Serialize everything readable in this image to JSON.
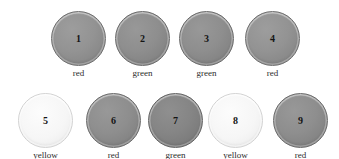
{
  "figure": {
    "background_color": "#ffffff",
    "rows": 2,
    "total_disks": 9
  },
  "disks": [
    {
      "number": "1",
      "label": "red",
      "tone": "tone-mid",
      "x": 51,
      "y": 11,
      "size": 55
    },
    {
      "number": "2",
      "label": "green",
      "tone": "tone-mid-dark",
      "x": 115,
      "y": 11,
      "size": 55
    },
    {
      "number": "3",
      "label": "green",
      "tone": "tone-mid-dark",
      "x": 179,
      "y": 11,
      "size": 55
    },
    {
      "number": "4",
      "label": "red",
      "tone": "tone-mid",
      "x": 245,
      "y": 11,
      "size": 55
    },
    {
      "number": "5",
      "label": "yellow",
      "tone": "tone-pale",
      "x": 18,
      "y": 93,
      "size": 55
    },
    {
      "number": "6",
      "label": "red",
      "tone": "tone-mid-dark",
      "x": 86,
      "y": 93,
      "size": 55
    },
    {
      "number": "7",
      "label": "green",
      "tone": "tone-dark",
      "x": 148,
      "y": 93,
      "size": 55
    },
    {
      "number": "8",
      "label": "yellow",
      "tone": "tone-pale",
      "x": 208,
      "y": 93,
      "size": 55
    },
    {
      "number": "9",
      "label": "red",
      "tone": "tone-mid-dark",
      "x": 273,
      "y": 93,
      "size": 55
    }
  ],
  "colors": {
    "background": "#ffffff",
    "disk_mid": "#939393",
    "disk_mid_dark": "#8e8e8e",
    "disk_dark": "#858585",
    "disk_pale": "#f6f6f6",
    "number_text": "#141414",
    "label_text": "#2b2b2b"
  }
}
